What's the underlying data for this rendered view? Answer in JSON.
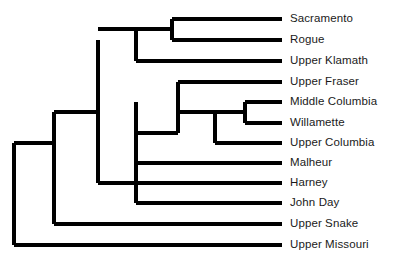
{
  "figure": {
    "type": "dendrogram",
    "title": "",
    "background_color": "#ffffff",
    "line_color": "#000000",
    "text_color": "#1a1a1a",
    "width": 395,
    "height": 260
  },
  "chart_data": {
    "type": "tree",
    "orientation": "left-to-right-rectangular",
    "title": "",
    "xlabel": "",
    "ylabel": "",
    "grid": false,
    "legend": null,
    "tip_count": 12,
    "tips": [
      {
        "label": "Sacramento",
        "y": 19,
        "branch_start_x": 172,
        "branch_end_x": 282
      },
      {
        "label": "Rogue",
        "y": 40,
        "branch_start_x": 172,
        "branch_end_x": 282
      },
      {
        "label": "Upper Klamath",
        "y": 61,
        "branch_start_x": 136,
        "branch_end_x": 282
      },
      {
        "label": "Upper Fraser",
        "y": 82,
        "branch_start_x": 178,
        "branch_end_x": 282
      },
      {
        "label": "Middle Columbia",
        "y": 102,
        "branch_start_x": 245,
        "branch_end_x": 282
      },
      {
        "label": "Willamette",
        "y": 123,
        "branch_start_x": 245,
        "branch_end_x": 282
      },
      {
        "label": "Upper Columbia",
        "y": 143,
        "branch_start_x": 215,
        "branch_end_x": 282
      },
      {
        "label": "Malheur",
        "y": 163,
        "branch_start_x": 136,
        "branch_end_x": 282
      },
      {
        "label": "Harney",
        "y": 183,
        "branch_start_x": 136,
        "branch_end_x": 282
      },
      {
        "label": "John Day",
        "y": 203,
        "branch_start_x": 136,
        "branch_end_x": 282
      },
      {
        "label": "Upper Snake",
        "y": 224,
        "branch_start_x": 54,
        "branch_end_x": 282
      },
      {
        "label": "Upper Missouri",
        "y": 245,
        "branch_start_x": 14,
        "branch_end_x": 282
      }
    ],
    "internal_nodes": [
      {
        "name": "root",
        "x": 14,
        "y_top": 143,
        "y_bottom": 245,
        "parent_x": 14
      },
      {
        "name": "snake-plus-clade",
        "x": 54,
        "y_top": 112,
        "y_bottom": 224,
        "parent_x": 14
      },
      {
        "name": "klamath-columbia-clade",
        "x": 98,
        "y_top": 40,
        "y_bottom": 183,
        "parent_x": 54
      },
      {
        "name": "klamath-clade",
        "x": 136,
        "y_top": 29,
        "y_bottom": 61,
        "parent_x": 98
      },
      {
        "name": "sacramento-rogue-clade",
        "x": 172,
        "y_top": 19,
        "y_bottom": 40,
        "parent_x": 136
      },
      {
        "name": "columbia-clade",
        "x": 136,
        "y_top": 102,
        "y_bottom": 203,
        "parent_x": 98
      },
      {
        "name": "fraser-columbia-clade",
        "x": 178,
        "y_top": 82,
        "y_bottom": 133,
        "parent_x": 136
      },
      {
        "name": "upper-columbia-clade",
        "x": 215,
        "y_top": 112,
        "y_bottom": 143,
        "parent_x": 178
      },
      {
        "name": "mid-col-willamette-clade",
        "x": 245,
        "y_top": 102,
        "y_bottom": 123,
        "parent_x": 215
      }
    ],
    "connectors": [
      {
        "name": "root-to-snake-node",
        "x1": 14,
        "x2": 54,
        "y": 143
      },
      {
        "name": "snake-node-to-main",
        "x1": 54,
        "x2": 98,
        "y": 112
      },
      {
        "name": "main-to-klamath",
        "x1": 98,
        "x2": 136,
        "y": 29
      },
      {
        "name": "main-to-columbia",
        "x1": 98,
        "x2": 136,
        "y": 183
      },
      {
        "name": "klamath-to-sac-rogue",
        "x1": 136,
        "x2": 172,
        "y": 29
      },
      {
        "name": "columbia-to-fraser-node",
        "x1": 136,
        "x2": 178,
        "y": 133
      },
      {
        "name": "fraser-node-to-upcol",
        "x1": 178,
        "x2": 215,
        "y": 112
      },
      {
        "name": "upcol-to-midcol-will",
        "x1": 215,
        "x2": 245,
        "y": 112
      }
    ],
    "label_x": 290,
    "tip_line_end_x": 282
  }
}
